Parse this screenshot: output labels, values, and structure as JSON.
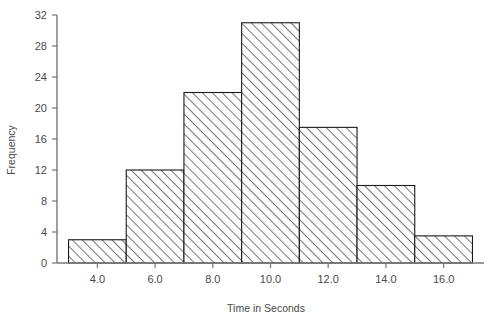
{
  "chart_data": {
    "type": "bar",
    "title": "",
    "xlabel": "Time in Seconds",
    "ylabel": "Frequency",
    "grid": false,
    "legend": "none",
    "xlim": [
      2.6,
      17.4
    ],
    "ylim": [
      0,
      32
    ],
    "xtick_labels": [
      "4.0",
      "6.0",
      "8.0",
      "10.0",
      "12.0",
      "14.0",
      "16.0"
    ],
    "xtick_values": [
      4,
      6,
      8,
      10,
      12,
      14,
      16
    ],
    "ytick_labels": [
      "0",
      "4",
      "8",
      "12",
      "16",
      "20",
      "24",
      "28",
      "32"
    ],
    "ytick_values": [
      0,
      4,
      8,
      12,
      16,
      20,
      24,
      28,
      32
    ],
    "bin_edges": [
      3,
      5,
      7,
      9,
      11,
      13,
      15,
      17
    ],
    "categories": [
      "3-5",
      "5-7",
      "7-9",
      "9-11",
      "11-13",
      "13-15",
      "15-17"
    ],
    "values": [
      3,
      12,
      22,
      31,
      17.5,
      10,
      3.5
    ],
    "bar_style": {
      "fill": "diagonal-hatch",
      "hatch_color": "#2b2b2b",
      "background": "#ffffff",
      "edge_color": "#1a1a1a"
    }
  },
  "axes": {
    "y_axis_title": "Frequency",
    "x_axis_title": "Time in Seconds"
  }
}
